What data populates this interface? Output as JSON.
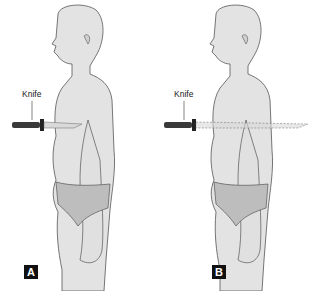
{
  "figure": {
    "panels": [
      {
        "id": "A",
        "badge": "A",
        "knife_label": "Knife",
        "description": "Knife tip at body surface (not penetrating)"
      },
      {
        "id": "B",
        "badge": "B",
        "knife_label": "Knife",
        "description": "Knife blade penetrating through torso (dashed)"
      }
    ],
    "colors": {
      "skin": "#e3e3e3",
      "outline": "#555555",
      "underwear": "#bdbdbd",
      "knife_handle": "#3a3a3a",
      "blade": "#d9d9d9",
      "badge_bg": "#111111"
    }
  }
}
